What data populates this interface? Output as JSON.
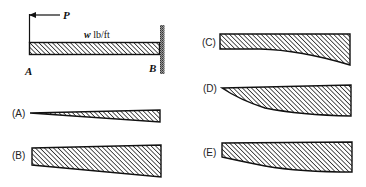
{
  "problem": {
    "force_label": "P",
    "load_label_var": "w",
    "load_label_unit": " lb/ft",
    "support_left_label": "A",
    "support_right_label": "B"
  },
  "options": [
    {
      "label": "(A)",
      "shape": "linear-taper-to-point"
    },
    {
      "label": "(B)",
      "shape": "linear-taper-trapezoid"
    },
    {
      "label": "(C)",
      "shape": "curved-bottom-flat-left"
    },
    {
      "label": "(D)",
      "shape": "curved-taper-to-point"
    },
    {
      "label": "(E)",
      "shape": "curved-bottom-trapezoid"
    }
  ],
  "colors": {
    "stroke": "#111111",
    "hatch": "#222222",
    "wall": "#777777",
    "background": "#ffffff"
  }
}
